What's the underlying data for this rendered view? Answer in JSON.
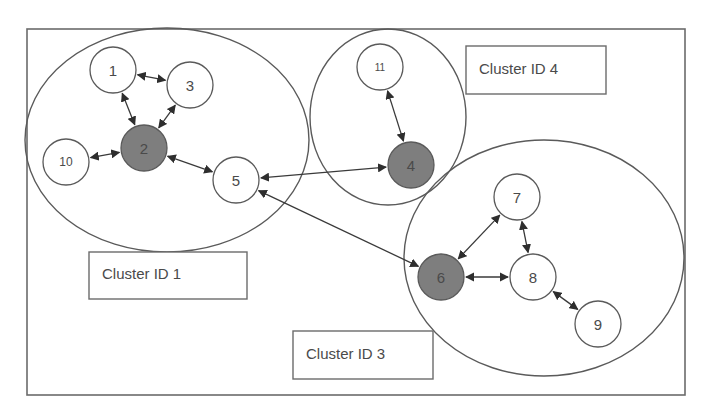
{
  "diagram": {
    "frame": {
      "x": 27,
      "y": 29,
      "width": 658,
      "height": 366
    },
    "colors": {
      "stroke": "#5a5a5a",
      "hub_fill": "#7e7e7e",
      "node_fill": "#ffffff",
      "text": "#4a4a4a",
      "edge": "#3a3a3a"
    },
    "clusters": [
      {
        "id": "1",
        "label": "Cluster ID 1",
        "shape": {
          "cx": 167,
          "cy": 140,
          "rx": 142,
          "ry": 112
        },
        "label_box": {
          "x": 89,
          "y": 252,
          "w": 158,
          "h": 47
        }
      },
      {
        "id": "4",
        "label": "Cluster ID 4",
        "shape": {
          "cx": 388,
          "cy": 117,
          "rx": 78,
          "ry": 88
        },
        "label_box": {
          "x": 466,
          "y": 46,
          "w": 140,
          "h": 48
        }
      },
      {
        "id": "3",
        "label": "Cluster ID 3",
        "shape": {
          "cx": 544,
          "cy": 258,
          "rx": 140,
          "ry": 118
        },
        "label_box": {
          "x": 293,
          "y": 331,
          "w": 140,
          "h": 48
        }
      }
    ],
    "nodes": [
      {
        "id": "1",
        "label": "1",
        "cx": 113,
        "cy": 70,
        "r": 23,
        "hub": false,
        "cluster": "1"
      },
      {
        "id": "2",
        "label": "2",
        "cx": 144,
        "cy": 148,
        "r": 23,
        "hub": true,
        "cluster": "1"
      },
      {
        "id": "3",
        "label": "3",
        "cx": 190,
        "cy": 85,
        "r": 23,
        "hub": false,
        "cluster": "1"
      },
      {
        "id": "10",
        "label": "10",
        "cx": 66,
        "cy": 162,
        "r": 23,
        "hub": false,
        "cluster": "1"
      },
      {
        "id": "5",
        "label": "5",
        "cx": 236,
        "cy": 180,
        "r": 23,
        "hub": false,
        "cluster": "1"
      },
      {
        "id": "11",
        "label": "11",
        "cx": 380,
        "cy": 67,
        "r": 23,
        "hub": false,
        "cluster": "4"
      },
      {
        "id": "4",
        "label": "4",
        "cx": 411,
        "cy": 165,
        "r": 23,
        "hub": true,
        "cluster": "4"
      },
      {
        "id": "7",
        "label": "7",
        "cx": 517,
        "cy": 197,
        "r": 23,
        "hub": false,
        "cluster": "3"
      },
      {
        "id": "6",
        "label": "6",
        "cx": 441,
        "cy": 277,
        "r": 23,
        "hub": true,
        "cluster": "3"
      },
      {
        "id": "8",
        "label": "8",
        "cx": 533,
        "cy": 277,
        "r": 23,
        "hub": false,
        "cluster": "3"
      },
      {
        "id": "9",
        "label": "9",
        "cx": 598,
        "cy": 324,
        "r": 23,
        "hub": false,
        "cluster": "3"
      }
    ],
    "edges": [
      {
        "from": "1",
        "to": "3",
        "bidirectional": true
      },
      {
        "from": "1",
        "to": "2",
        "bidirectional": true
      },
      {
        "from": "3",
        "to": "2",
        "bidirectional": true
      },
      {
        "from": "10",
        "to": "2",
        "bidirectional": true
      },
      {
        "from": "2",
        "to": "5",
        "bidirectional": true
      },
      {
        "from": "5",
        "to": "4",
        "bidirectional": true
      },
      {
        "from": "11",
        "to": "4",
        "bidirectional": true
      },
      {
        "from": "5",
        "to": "6",
        "bidirectional": true
      },
      {
        "from": "6",
        "to": "7",
        "bidirectional": true
      },
      {
        "from": "7",
        "to": "8",
        "bidirectional": true
      },
      {
        "from": "6",
        "to": "8",
        "bidirectional": true
      },
      {
        "from": "8",
        "to": "9",
        "bidirectional": true
      }
    ]
  }
}
